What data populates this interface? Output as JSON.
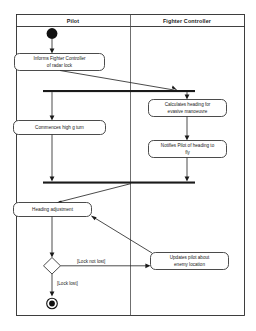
{
  "diagram": {
    "type": "uml-activity-diagram",
    "title": "",
    "lanes": [
      {
        "id": "pilot",
        "label": "Pilot"
      },
      {
        "id": "fighter-controller",
        "label": "Fighter Controller"
      }
    ],
    "nodes": [
      {
        "id": "start",
        "kind": "initial-node",
        "lane": "pilot",
        "label": ""
      },
      {
        "id": "informs-fc",
        "kind": "activity",
        "lane": "pilot",
        "label_line1": "Informs Fighter Controller",
        "label_line2": "of radar lock"
      },
      {
        "id": "fork-1",
        "kind": "fork-bar",
        "label": ""
      },
      {
        "id": "commences-turn",
        "kind": "activity",
        "lane": "pilot",
        "label_line1": "Commences high g turn",
        "label_line2": ""
      },
      {
        "id": "calculates-heading",
        "kind": "activity",
        "lane": "fighter-controller",
        "label_line1": "Calculates heading for",
        "label_line2": "evasive manoeuvre"
      },
      {
        "id": "notifies-pilot",
        "kind": "activity",
        "lane": "fighter-controller",
        "label_line1": "Notifies Pilot of heading to",
        "label_line2": "fly"
      },
      {
        "id": "join-1",
        "kind": "join-bar",
        "label": ""
      },
      {
        "id": "heading-adjustment",
        "kind": "activity",
        "lane": "pilot",
        "label_line1": "Heading adjustment",
        "label_line2": ""
      },
      {
        "id": "lock-decision",
        "kind": "decision-node",
        "lane": "pilot",
        "label": ""
      },
      {
        "id": "updates-pilot",
        "kind": "activity",
        "lane": "fighter-controller",
        "label_line1": "Updates pilot about",
        "label_line2": "enemy location"
      },
      {
        "id": "final",
        "kind": "final-node",
        "lane": "pilot",
        "label": ""
      }
    ],
    "guards": [
      {
        "id": "guard-lock-not-lost",
        "label": "[Lock not lost]",
        "from": "lock-decision",
        "to": "updates-pilot"
      },
      {
        "id": "guard-lock-lost",
        "label": "[Lock lost]",
        "from": "lock-decision",
        "to": "final"
      }
    ],
    "colors": {
      "stroke": "#2b2b2b",
      "fill": "#ffffff",
      "node": "#111111",
      "background": "#ffffff"
    }
  }
}
